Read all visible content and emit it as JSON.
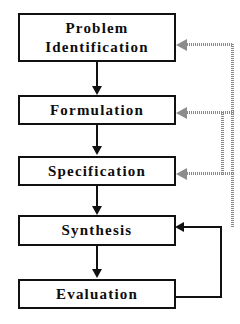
{
  "diagram": {
    "colors": {
      "box_border": "#111111",
      "box_fill": "#ffffff",
      "solid_connector": "#111111",
      "dotted_connector": "#8a8a8a",
      "text": "#0d0d0d",
      "background": "#ffffff"
    },
    "nodes": [
      {
        "id": "problem-identification",
        "label": "Problem\nIdentification"
      },
      {
        "id": "formulation",
        "label": "Formulation"
      },
      {
        "id": "specification",
        "label": "Specification"
      },
      {
        "id": "synthesis",
        "label": "Synthesis"
      },
      {
        "id": "evaluation",
        "label": "Evaluation"
      }
    ],
    "edges": [
      {
        "id": "edge-problem-to-formulation",
        "from": "problem-identification",
        "to": "formulation",
        "style": "solid",
        "direction": "down"
      },
      {
        "id": "edge-formulation-to-specification",
        "from": "formulation",
        "to": "specification",
        "style": "solid",
        "direction": "down"
      },
      {
        "id": "edge-specification-to-synthesis",
        "from": "specification",
        "to": "synthesis",
        "style": "solid",
        "direction": "down"
      },
      {
        "id": "edge-synthesis-to-evaluation",
        "from": "synthesis",
        "to": "evaluation",
        "style": "solid",
        "direction": "down"
      },
      {
        "id": "edge-evaluation-to-synthesis",
        "from": "evaluation",
        "to": "synthesis",
        "style": "solid",
        "direction": "feedback-left"
      },
      {
        "id": "edge-feedback-to-specification",
        "from": "evaluation",
        "to": "specification",
        "style": "dotted",
        "direction": "feedback-left"
      },
      {
        "id": "edge-feedback-to-formulation",
        "from": "evaluation",
        "to": "formulation",
        "style": "dotted",
        "direction": "feedback-left"
      },
      {
        "id": "edge-feedback-to-problem",
        "from": "evaluation",
        "to": "problem-identification",
        "style": "dotted",
        "direction": "feedback-left"
      }
    ]
  }
}
